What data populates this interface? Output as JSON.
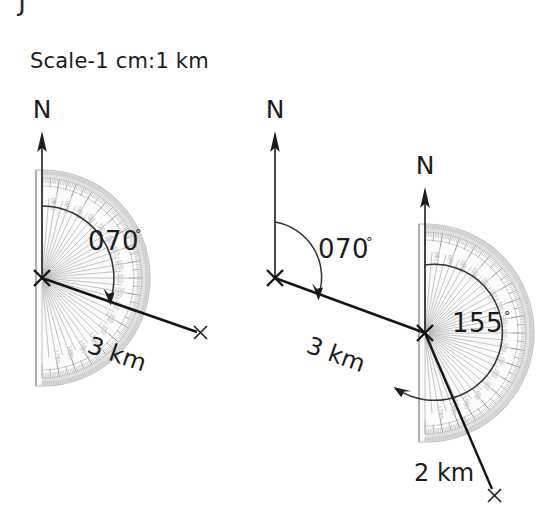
{
  "page": {
    "width": 553,
    "height": 518,
    "background": "#ffffff",
    "ink_color": "#1c1c1c",
    "protractor_color": "#c2c2c2",
    "cutoff_glyph": "J"
  },
  "scale_note": {
    "text": "Scale-1 cm:1 km"
  },
  "diagrams": [
    {
      "id": "left-diagram",
      "name": "single-leg-bearing-diagram",
      "north_label": "N",
      "origin_marker": "×",
      "endpoint_marker": "×",
      "bearing_label": "070",
      "bearing_degree_symbol": "°",
      "distance_label": "3 km",
      "protractor": {
        "center_x": 42,
        "center_y": 278,
        "radius": 108,
        "orientation": "flat-edge-vertical-left",
        "scale_max": 180
      },
      "bearing_value": 70,
      "distance_value": 3,
      "distance_unit": "km"
    },
    {
      "id": "right-diagram",
      "name": "two-leg-bearing-diagram",
      "north_label_first": "N",
      "north_label_second": "N",
      "origin_marker": "×",
      "waypoint_marker": "×",
      "endpoint_marker": "×",
      "first_bearing_label": "070",
      "first_bearing_degree_symbol": "°",
      "first_distance_label": "3 km",
      "second_bearing_label": "155",
      "second_bearing_degree_symbol": "°",
      "second_distance_label": "2 km",
      "protractor": {
        "center_x": 425,
        "center_y": 333,
        "radius": 109,
        "orientation": "flat-edge-vertical-left",
        "scale_max": 180
      },
      "first_bearing_value": 70,
      "first_distance_value": 3,
      "second_bearing_value": 155,
      "second_distance_value": 2,
      "distance_unit": "km"
    }
  ]
}
